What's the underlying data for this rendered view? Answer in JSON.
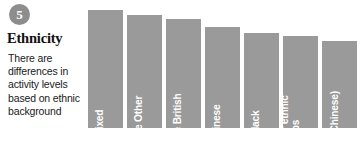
{
  "panel": {
    "badge_number": "5",
    "title": "Ethnicity",
    "body": "There are differences in activity levels based on ethnic background"
  },
  "colors": {
    "bar": "#9a9a9a",
    "badge": "#8d8d8d",
    "background": "#ffffff",
    "value_text": "#0d0d0d",
    "bar_label_text": "#ffffff"
  },
  "chart_data": {
    "type": "bar",
    "title": "Ethnicity",
    "xlabel": "",
    "ylabel": "",
    "ylim": [
      0,
      68
    ],
    "grid": false,
    "legend": "none",
    "orientation": "vertical",
    "categories": [
      "Mixed",
      "White Other",
      "White British",
      "Chinese",
      "Black",
      "Other ethnic\ngroups",
      "Asian\n(excl Chinese)"
    ],
    "values": [
      68,
      65,
      63,
      58,
      55,
      53,
      50
    ],
    "value_labels": [
      "68%",
      "65%",
      "63%",
      "58%",
      "55%",
      "53%",
      "50%"
    ]
  }
}
